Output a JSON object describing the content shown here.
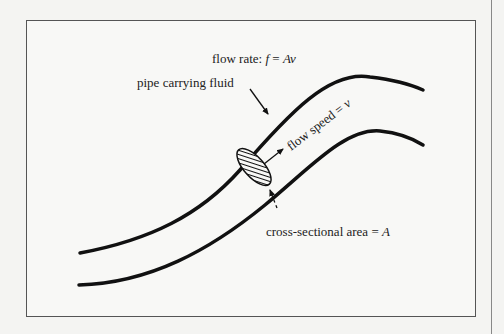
{
  "diagram": {
    "labels": {
      "flow_rate_prefix": "flow rate: ",
      "flow_rate_formula_f": "f",
      "flow_rate_formula_eq": " = ",
      "flow_rate_formula_rhs": "Av",
      "pipe": "pipe carrying fluid",
      "flow_speed_prefix": "flow speed = ",
      "flow_speed_var": "v",
      "area_prefix": "cross-sectional area = ",
      "area_var": "A"
    },
    "colors": {
      "stroke": "#111111",
      "frame": "#555555",
      "background": "#f8f8f6"
    }
  }
}
